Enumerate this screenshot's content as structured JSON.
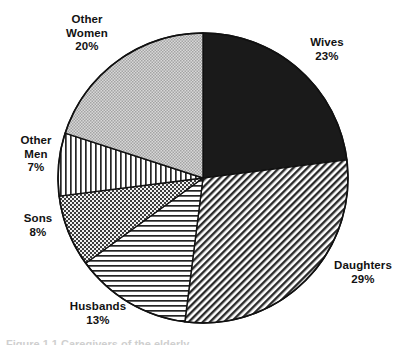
{
  "figure": {
    "caption": "Figure 1.1  Caregivers of the elderly",
    "center_x": 203,
    "center_y": 178,
    "radius": 145
  },
  "chart_data": {
    "type": "pie",
    "title": "",
    "subtitle": "",
    "xlabel": "",
    "ylabel": "",
    "legend_position": "outside-labels",
    "grid": false,
    "start_angle_deg": 0,
    "direction": "clockwise",
    "units": "percent",
    "categories": [
      "Wives",
      "Daughters",
      "Husbands",
      "Sons",
      "Other Men",
      "Other Women"
    ],
    "values": [
      23,
      29,
      13,
      8,
      7,
      20
    ],
    "total": 100,
    "slices": [
      {
        "label": "Wives",
        "value": 23,
        "value_text": "23%",
        "fill": "solid-black",
        "color": "#1a1a1a",
        "start_deg": 0,
        "end_deg": 82.8,
        "label_position": "top-right"
      },
      {
        "label": "Daughters",
        "value": 29,
        "value_text": "29%",
        "fill": "diagonal-hatch-forward",
        "color": "#2b2b2b",
        "start_deg": 82.8,
        "end_deg": 187.2,
        "label_position": "right"
      },
      {
        "label": "Husbands",
        "value": 13,
        "value_text": "13%",
        "fill": "horizontal-lines",
        "color": "#232323",
        "start_deg": 187.2,
        "end_deg": 234.0,
        "label_position": "bottom-left"
      },
      {
        "label": "Sons",
        "value": 8,
        "value_text": "8%",
        "fill": "dark-checkerboard",
        "color": "#3a3a3a",
        "start_deg": 234.0,
        "end_deg": 262.8,
        "label_position": "left"
      },
      {
        "label": "Other Men",
        "value": 7,
        "value_text": "7%",
        "fill": "vertical-lines",
        "color": "#262626",
        "start_deg": 262.8,
        "end_deg": 288.0,
        "label_position": "upper-left"
      },
      {
        "label": "Other Women",
        "value": 20,
        "value_text": "20%",
        "fill": "light-gray-stipple",
        "color": "#b9b9b9",
        "start_deg": 288.0,
        "end_deg": 360.0,
        "label_position": "top-left"
      }
    ]
  },
  "labels": {
    "other_women": {
      "line1": "Other",
      "line2": "Women",
      "value": "20%"
    },
    "wives": {
      "line1": "Wives",
      "value": "23%"
    },
    "other_men": {
      "line1": "Other",
      "line2": "Men",
      "value": "7%"
    },
    "sons": {
      "line1": "Sons",
      "value": "8%"
    },
    "daughters": {
      "line1": "Daughters",
      "value": "29%"
    },
    "husbands": {
      "line1": "Husbands",
      "value": "13%"
    }
  }
}
